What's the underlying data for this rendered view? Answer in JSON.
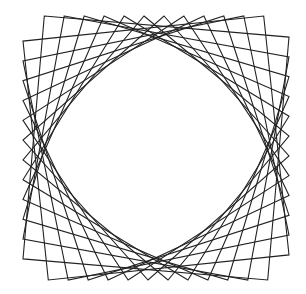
{
  "figure": {
    "stroke_color": "#222222",
    "background_color": "#ffffff",
    "frame": {
      "cx": 156,
      "cy": 148,
      "half_width": 133,
      "half_height": 132
    },
    "square_count": 12,
    "corner_fractions": [
      0.08,
      0.155,
      0.23,
      0.305,
      0.38,
      0.455,
      0.53,
      0.605,
      0.68,
      0.755,
      0.83,
      0.905
    ]
  }
}
